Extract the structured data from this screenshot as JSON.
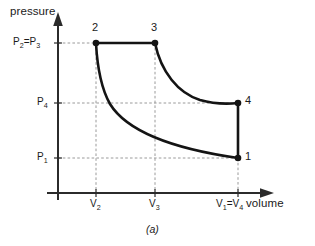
{
  "figure": {
    "caption": "(a)",
    "axes": {
      "y_title": "pressure",
      "x_title": "volume"
    },
    "colors": {
      "curve": "#141414",
      "axis": "#2b2b2b",
      "gridline": "#9a9a9a",
      "text": "#1a1a1a",
      "background": "#ffffff"
    },
    "y_ticks": [
      {
        "name": "p23",
        "label_html": "P<sub>2</sub>=P<sub>3</sub>",
        "label_text": "P2=P3"
      },
      {
        "name": "p4",
        "label_html": "P<sub>4</sub>",
        "label_text": "P4"
      },
      {
        "name": "p1",
        "label_html": "P<sub>1</sub>",
        "label_text": "P1"
      }
    ],
    "x_ticks": [
      {
        "name": "v2",
        "label_html": "V<sub>2</sub>",
        "label_text": "V2"
      },
      {
        "name": "v3",
        "label_html": "V<sub>3</sub>",
        "label_text": "V3"
      },
      {
        "name": "v14",
        "label_html": "V<sub>1</sub>=V<sub>4</sub>",
        "label_text": "V1=V4"
      }
    ],
    "state_labels": [
      {
        "name": "1",
        "label": "1"
      },
      {
        "name": "2",
        "label": "2"
      },
      {
        "name": "3",
        "label": "3"
      },
      {
        "name": "4",
        "label": "4"
      }
    ]
  },
  "chart_data": {
    "type": "line",
    "title": "",
    "subtitle": "",
    "xlabel": "volume",
    "ylabel": "pressure",
    "grid": true,
    "legend_position": "none",
    "annotations": [
      "(a)"
    ],
    "axis_tick_labels": {
      "x": [
        "V2",
        "V3",
        "V1=V4"
      ],
      "y": [
        "P1",
        "P4",
        "P2=P3"
      ]
    },
    "xlim": [
      0,
      1
    ],
    "ylim": [
      0,
      1
    ],
    "points": [
      {
        "state": "1",
        "volume_label": "V1=V4",
        "pressure_label": "P1",
        "x": 0.78,
        "y": 0.195
      },
      {
        "state": "2",
        "volume_label": "V2",
        "pressure_label": "P2=P3",
        "x": 0.215,
        "y": 0.845
      },
      {
        "state": "3",
        "volume_label": "V3",
        "pressure_label": "P2=P3",
        "x": 0.48,
        "y": 0.845
      },
      {
        "state": "4",
        "volume_label": "V1=V4",
        "pressure_label": "P4",
        "x": 0.78,
        "y": 0.505
      }
    ],
    "series": [
      {
        "name": "1-2 isentropic compression",
        "from": "1",
        "to": "2",
        "process": "isentropic",
        "x": [
          0.78,
          0.66,
          0.55,
          0.45,
          0.36,
          0.3,
          0.255,
          0.228,
          0.215
        ],
        "y": [
          0.195,
          0.225,
          0.265,
          0.315,
          0.395,
          0.485,
          0.605,
          0.745,
          0.845
        ]
      },
      {
        "name": "2-3 constant pressure heat addition",
        "from": "2",
        "to": "3",
        "process": "isobaric",
        "x": [
          0.215,
          0.48
        ],
        "y": [
          0.845,
          0.845
        ]
      },
      {
        "name": "3-4 isentropic expansion",
        "from": "3",
        "to": "4",
        "process": "isentropic",
        "x": [
          0.48,
          0.505,
          0.535,
          0.575,
          0.625,
          0.685,
          0.735,
          0.78
        ],
        "y": [
          0.845,
          0.77,
          0.695,
          0.625,
          0.565,
          0.525,
          0.51,
          0.505
        ]
      },
      {
        "name": "4-1 constant volume heat rejection",
        "from": "4",
        "to": "1",
        "process": "isochoric",
        "x": [
          0.78,
          0.78
        ],
        "y": [
          0.505,
          0.195
        ]
      }
    ]
  }
}
